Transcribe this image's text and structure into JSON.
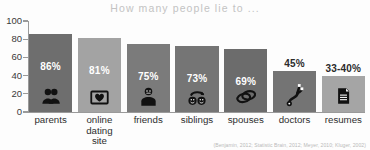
{
  "chart_data": {
    "type": "bar",
    "title": "How many people lie to ...",
    "xlabel": "",
    "ylabel": "",
    "ylim": [
      0,
      100
    ],
    "ytick_labels": [
      "100",
      "80",
      "60",
      "40",
      "20",
      "0"
    ],
    "ytick_values": [
      100,
      80,
      60,
      40,
      20,
      0
    ],
    "grid": false,
    "legend": "none",
    "categories": [
      "parents",
      "online dating site",
      "friends",
      "siblings",
      "spouses",
      "doctors",
      "resumes"
    ],
    "values": [
      86,
      81,
      75,
      73,
      69,
      45,
      40
    ],
    "value_labels": [
      "86%",
      "81%",
      "75%",
      "73%",
      "69%",
      "45%",
      "33-40%"
    ],
    "label_position": [
      "inside",
      "inside",
      "inside",
      "inside",
      "inside",
      "above",
      "above"
    ],
    "bar_colors": [
      "#6e6e6e",
      "#a3a3a3",
      "#7b7b7b",
      "#757575",
      "#6c6c6c",
      "#747474",
      "#a5a5a5"
    ],
    "bar_icons": [
      "people-icon",
      "heart-frame-icon",
      "person-icon",
      "two-faces-arc-icon",
      "wedding-rings-icon",
      "stethoscope-icon",
      "document-icon"
    ],
    "source_note": "(Benjamin, 2012; Statistic Brain, 2012; Meyer, 2010; Kluger, 2002)"
  },
  "colors": {
    "title": "#c3c3c3",
    "axis": "#9a9a9a",
    "value_inside": "#ffffff",
    "value_above": "#2b2b2b",
    "background": "#fdfdfd"
  },
  "cat_label_lines": [
    [
      "parents"
    ],
    [
      "online",
      "dating",
      "site"
    ],
    [
      "friends"
    ],
    [
      "siblings"
    ],
    [
      "spouses"
    ],
    [
      "doctors"
    ],
    [
      "resumes"
    ]
  ]
}
